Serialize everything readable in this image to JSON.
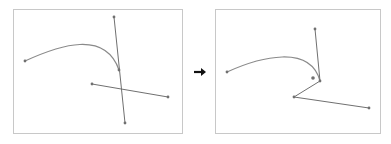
{
  "diagram": {
    "arrow_icon": "right-arrow-icon",
    "colors": {
      "frame": "#c8c8c8",
      "curve": "#8a8a8a",
      "handle": "#707070",
      "point": "#707070",
      "arrow": "#111111"
    },
    "before": {
      "label": "before",
      "frame": {
        "x": 13,
        "y": 9,
        "w": 169,
        "h": 124
      },
      "curve_path": "M25,61 C60,45 105,30 119,70",
      "anchor_points": [
        [
          25,
          61
        ],
        [
          119,
          70
        ]
      ],
      "handle_lines": [
        {
          "from": [
            114,
            17
          ],
          "to": [
            125,
            123
          ]
        },
        {
          "from": [
            92,
            84
          ],
          "to": [
            168,
            97
          ]
        }
      ],
      "handle_points": [
        [
          114,
          17
        ],
        [
          125,
          123
        ],
        [
          92,
          84
        ],
        [
          168,
          97
        ]
      ]
    },
    "after": {
      "label": "after",
      "frame": {
        "x": 215,
        "y": 9,
        "w": 165,
        "h": 124
      },
      "curve_path": "M227,72 C260,57 310,44 320,81",
      "anchor_points": [
        [
          227,
          72
        ],
        [
          320,
          81
        ]
      ],
      "handle_lines": [
        {
          "from": [
            320,
            81
          ],
          "to": [
            315,
            29
          ]
        },
        {
          "from": [
            320,
            81
          ],
          "to": [
            294,
            97
          ]
        },
        {
          "from": [
            294,
            97
          ],
          "to": [
            369,
            108
          ]
        }
      ],
      "handle_points": [
        [
          315,
          29
        ],
        [
          294,
          97
        ],
        [
          369,
          108
        ]
      ],
      "extra_point": [
        313,
        78
      ]
    }
  }
}
